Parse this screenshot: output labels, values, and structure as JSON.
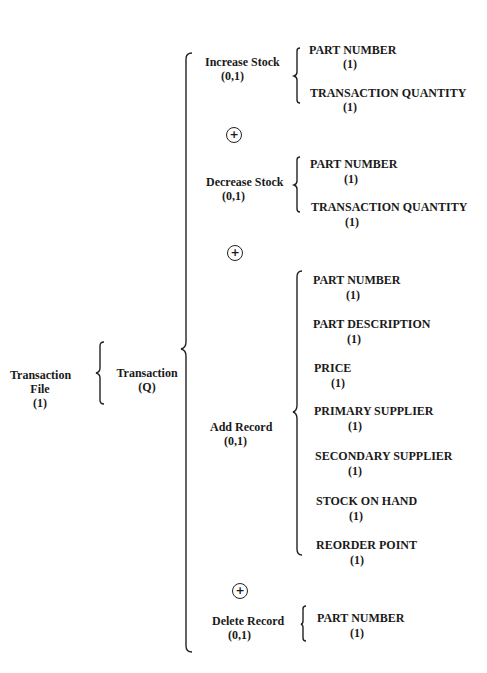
{
  "diagram": {
    "root": {
      "label": "Transaction",
      "label2": "File",
      "card": "(1)"
    },
    "transaction": {
      "label": "Transaction",
      "card": "(Q)"
    },
    "exclusive_or_symbol": "+",
    "branches": [
      {
        "label": "Increase Stock",
        "card": "(0,1)",
        "fields": [
          {
            "label": "PART NUMBER",
            "card": "(1)"
          },
          {
            "label": "TRANSACTION QUANTITY",
            "card": "(1)"
          }
        ]
      },
      {
        "label": "Decrease Stock",
        "card": "(0,1)",
        "fields": [
          {
            "label": "PART NUMBER",
            "card": "(1)"
          },
          {
            "label": "TRANSACTION QUANTITY",
            "card": "(1)"
          }
        ]
      },
      {
        "label": "Add Record",
        "card": "(0,1)",
        "fields": [
          {
            "label": "PART NUMBER",
            "card": "(1)"
          },
          {
            "label": "PART DESCRIPTION",
            "card": "(1)"
          },
          {
            "label": "PRICE",
            "card": "(1)"
          },
          {
            "label": "PRIMARY SUPPLIER",
            "card": "(1)"
          },
          {
            "label": "SECONDARY SUPPLIER",
            "card": "(1)"
          },
          {
            "label": "STOCK ON HAND",
            "card": "(1)"
          },
          {
            "label": "REORDER POINT",
            "card": "(1)"
          }
        ]
      },
      {
        "label": "Delete Record",
        "card": "(0,1)",
        "fields": [
          {
            "label": "PART NUMBER",
            "card": "(1)"
          }
        ]
      }
    ]
  }
}
